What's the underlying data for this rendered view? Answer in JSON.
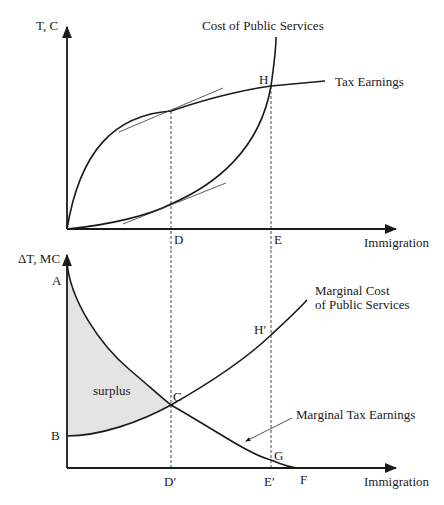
{
  "top_panel": {
    "y_axis_label": "T, C",
    "x_axis_label": "Immigration",
    "curves": {
      "cost": "Cost of Public Services",
      "tax": "Tax Earnings"
    },
    "points": {
      "H": "H",
      "D": "D",
      "E": "E"
    }
  },
  "bottom_panel": {
    "y_axis_label": "ΔT, MC",
    "x_axis_label": "Immigration",
    "curves": {
      "marginal_cost_line1": "Marginal Cost",
      "marginal_cost_line2": "of Public Services",
      "marginal_tax": "Marginal Tax Earnings"
    },
    "region_label": "surplus",
    "points": {
      "A": "A",
      "B": "B",
      "C": "C",
      "G": "G",
      "F": "F",
      "H_prime": "Hʹ",
      "D_prime": "Dʹ",
      "E_prime": "Eʹ"
    }
  },
  "colors": {
    "line": "#1a1a1a",
    "surplus_fill": "#e4e4e4",
    "background": "#ffffff"
  }
}
